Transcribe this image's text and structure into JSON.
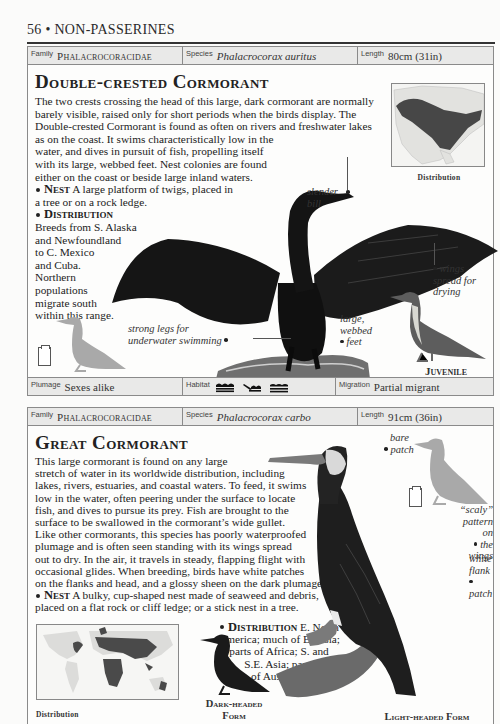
{
  "page": {
    "number": "56",
    "separator": "•",
    "section": "NON-PASSERINES",
    "running_head": "56 • NON-PASSERINES"
  },
  "entries": [
    {
      "info_top": {
        "family_label": "Family",
        "family_value": "Phalacrocoracidae",
        "species_label": "Species",
        "species_value": "Phalacrocorax auritus",
        "length_label": "Length",
        "length_value": "80cm (31in)"
      },
      "title": "Double-crested Cormorant",
      "description": "The two crests crossing the head of this large, dark cormorant are normally barely visible, raised only for short periods when the birds display. The Double-crested Cormorant is found as often on rivers and freshwater lakes as on the coast. It swims characteristically low in the water, and dives in pursuit of fish, propelling itself with its large, webbed feet. Nest colonies are found either on the coast or beside large inland waters.",
      "description_lines": [
        "The two crests crossing the head of this large, dark cormorant are normally",
        "barely visible, raised only for short periods when the birds display. The",
        "Double-crested Cormorant is found as often on rivers and freshwater lakes",
        "as on the coast. It  swims characteristically low in the",
        "water, and dives in pursuit of fish, propelling itself",
        "with its large, webbed feet. Nest colonies are found",
        "either on the coast or beside large inland waters."
      ],
      "nest_heading": "Nest",
      "nest_text_lines": [
        "A large platform of twigs, placed in",
        "a tree or on a rock ledge."
      ],
      "distribution_heading": "Distribution",
      "distribution_text_lines": [
        "Breeds from S. Alaska",
        "and Newfoundland",
        "to C. Mexico",
        "and Cuba.",
        "Northern",
        "populations",
        "migrate south",
        "within this range."
      ],
      "map_caption": "Distribution",
      "callouts": {
        "slender_bill": [
          "slender",
          "bill"
        ],
        "wings_spread": [
          "wings",
          "spread for",
          "drying"
        ],
        "strong_legs": [
          "strong legs for",
          "underwater swimming"
        ],
        "webbed_feet": [
          "large,",
          "webbed",
          "feet"
        ]
      },
      "juvenile_caption": "Juvenile",
      "info_bottom": {
        "plumage_label": "Plumage",
        "plumage_value": "Sexes alike",
        "habitat_label": "Habitat",
        "habitat_icons": [
          "wave-water-icon",
          "marsh-icon",
          "lake-lines-icon"
        ],
        "migration_label": "Migration",
        "migration_value": "Partial migrant"
      }
    },
    {
      "info_top": {
        "family_label": "Family",
        "family_value": "Phalacrocoracidae",
        "species_label": "Species",
        "species_value": "Phalacrocorax carbo",
        "length_label": "Length",
        "length_value": "91cm (36in)"
      },
      "title": "Great Cormorant",
      "description_lines": [
        "This large cormorant is found on any large",
        "stretch of water in its worldwide distribution, including",
        "lakes, rivers, estuaries, and coastal waters. To feed, it swims",
        "low in the water, often peering under the surface to locate",
        "fish, and dives to pursue its prey. Fish are brought to the",
        "surface to be swallowed in the cormorant’s wide gullet.",
        "Like other cormorants, this species has poorly waterproofed",
        "plumage and is often seen standing with its wings spread",
        "out to dry. In the air, it travels in steady, flapping flight with",
        "occasional glides. When breeding, birds have white patches",
        "on the flanks and head, and a glossy sheen on the dark plumage."
      ],
      "nest_heading": "Nest",
      "nest_text_lines": [
        "A bulky, cup-shaped nest made of seaweed and debris,",
        "placed on a flat rock or cliff ledge; or a stick nest in a tree."
      ],
      "distribution_heading": "Distribution",
      "distribution_first": "E. North",
      "distribution_text_lines": [
        "America; much of Eurasia;",
        "parts of Africa; S. and",
        "S.E. Asia; parts",
        "of Australia."
      ],
      "map_caption": "Distribution",
      "callouts": {
        "bare_patch": [
          "bare",
          "patch"
        ],
        "scaly_pattern": [
          "“scaly”",
          "pattern on",
          "the wings"
        ],
        "white_flank": [
          "white",
          "flank",
          "patch"
        ]
      },
      "dark_form_caption": [
        "Dark-headed",
        "Form"
      ],
      "light_form_caption": "Light-headed Form"
    }
  ],
  "colors": {
    "text": "#1c1c1c",
    "info_row_bg": "#e9e9e8",
    "border": "#8a8a8a",
    "silhouette": "#a9a9a9",
    "map_range": "#4a4a4a",
    "map_land": "#d8d8d6"
  }
}
